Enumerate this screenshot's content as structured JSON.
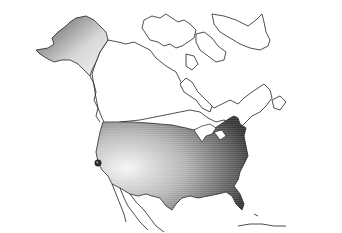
{
  "map": {
    "region": "North America",
    "highlighted_country": "United States",
    "highlight_style": "gradient-shaded",
    "colors": {
      "background": "#ffffff",
      "outline": "#222222",
      "gradient_light": "#f4f4f4",
      "gradient_mid": "#a8a8a8",
      "gradient_dark": "#3a3a3a"
    },
    "marker": {
      "label": "",
      "approx_location": "San Francisco, California",
      "color": "#333333"
    }
  }
}
